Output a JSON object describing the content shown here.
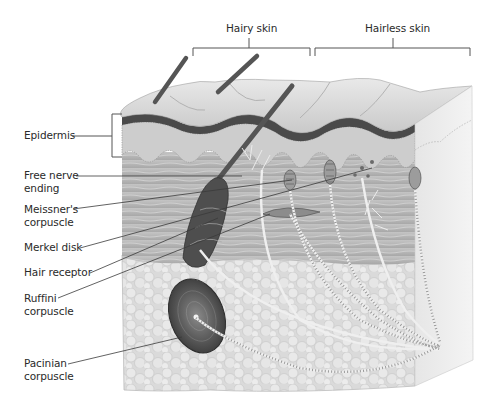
{
  "diagram": {
    "type": "anatomical-illustration",
    "region_labels": [
      {
        "id": "hairy",
        "text": "Hairy skin"
      },
      {
        "id": "hairless",
        "text": "Hairless skin"
      }
    ],
    "layer_labels": [
      {
        "id": "epidermis",
        "text": "Epidermis"
      }
    ],
    "receptor_labels": [
      {
        "id": "free-nerve-ending",
        "lines": [
          "Free nerve",
          "ending"
        ]
      },
      {
        "id": "meissner",
        "lines": [
          "Meissner's",
          "corpuscle"
        ]
      },
      {
        "id": "merkel",
        "lines": [
          "Merkel disk"
        ]
      },
      {
        "id": "hair-receptor",
        "lines": [
          "Hair receptor"
        ]
      },
      {
        "id": "ruffini",
        "lines": [
          "Ruffini",
          "corpuscle"
        ]
      },
      {
        "id": "pacinian",
        "lines": [
          "Pacinian",
          "corpuscle"
        ]
      }
    ],
    "colors": {
      "stratum_corneum": "#d8d8d8",
      "dark_band": "#4a4a4a",
      "dermis": "#b4b4b4",
      "fat": "#dcdcdc",
      "hair": "#555555",
      "leader": "#444444"
    }
  }
}
